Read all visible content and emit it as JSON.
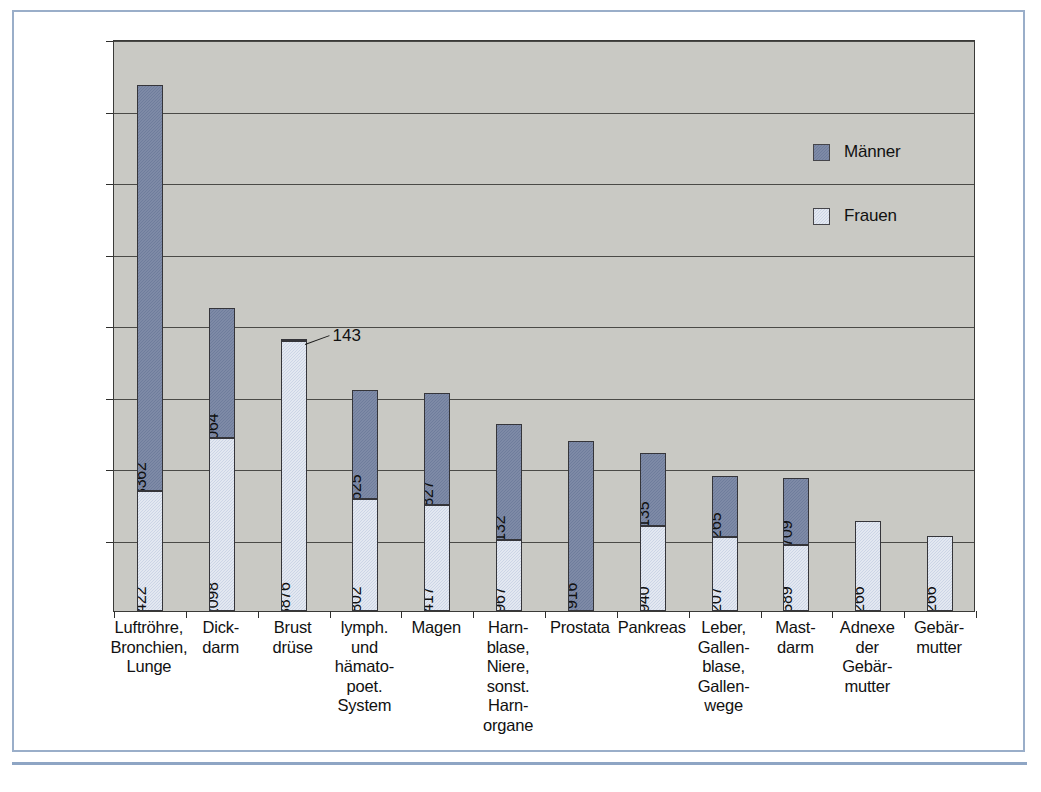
{
  "chart_data": {
    "type": "bar",
    "subtype": "stacked-vertical",
    "title": "",
    "xlabel": "",
    "ylabel": "",
    "ylim": [
      0,
      40000
    ],
    "ytick_step": 5000,
    "yticks": [
      "5000",
      "10000",
      "15000",
      "20000",
      "25000",
      "30000",
      "35000",
      "40000"
    ],
    "grid": true,
    "legend_position": "upper-right-inside",
    "categories": [
      "Luftröhre,\nBronchien,\nLunge",
      "Dick-\ndarm",
      "Brust\ndrüse",
      "lymph.\nund\nhämato-\npoet.\nSystem",
      "Magen",
      "Harn-\nblase,\nNiere,\nsonst.\nHarn-\norgane",
      "Prostata",
      "Pankreas",
      "Leber,\nGallen-\nblase,\nGallen-\nwege",
      "Mast-\ndarm",
      "Adnexe\nder\nGebär-\nmutter",
      "Gebär-\nmutter"
    ],
    "series": [
      {
        "name": "Frauen",
        "color": "#ccd5e6",
        "values": [
          8422,
          12098,
          18876,
          7802,
          7417,
          4967,
          0,
          5940,
          5207,
          4589,
          6266,
          5266
        ]
      },
      {
        "name": "Männer",
        "color": "#6f7d9c",
        "values": [
          28362,
          9064,
          143,
          7625,
          7827,
          8132,
          11916,
          5135,
          4265,
          4709,
          0,
          0
        ]
      }
    ],
    "annotations": [
      {
        "text": "143",
        "category": "Brust\ndrüse",
        "series": "Männer",
        "value": 143,
        "style": "external-leader-line"
      }
    ],
    "totals": [
      36784,
      21162,
      19019,
      15427,
      15244,
      13099,
      11916,
      11075,
      9472,
      9298,
      6266,
      5266
    ]
  },
  "legend": {
    "items": [
      {
        "label": "Männer",
        "color": "#6f7d9c"
      },
      {
        "label": "Frauen",
        "color": "#ccd5e6"
      }
    ]
  },
  "colors": {
    "plot_background": "#c9c9c4",
    "frame": "#9aaec9",
    "axis": "#3a3a38",
    "gridline": "#4a4a47",
    "male": "#6f7d9c",
    "female": "#ccd5e6",
    "text": "#111111"
  }
}
